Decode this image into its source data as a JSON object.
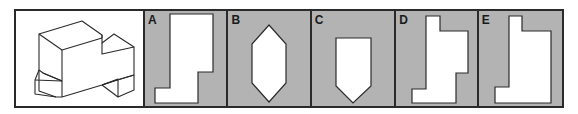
{
  "question": {
    "figure": "isometric-3d-block-drawing"
  },
  "options": [
    {
      "label": "A",
      "shape": "l-shaped-silhouette"
    },
    {
      "label": "B",
      "shape": "elongated-hexagon"
    },
    {
      "label": "C",
      "shape": "pentagon-pointing-down"
    },
    {
      "label": "D",
      "shape": "stepped-silhouette"
    },
    {
      "label": "E",
      "shape": "l-shaped-notched-silhouette"
    }
  ],
  "colors": {
    "panel_bg": "#b3b3b3",
    "shape_fill": "#ffffff",
    "stroke": "#2a2a2a"
  }
}
